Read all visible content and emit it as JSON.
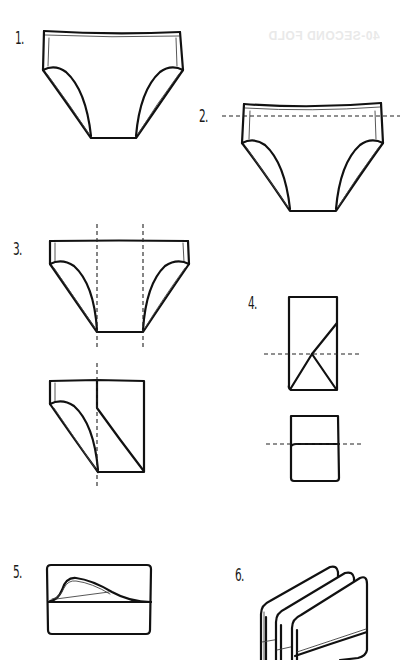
{
  "document": {
    "type": "folding-instructions",
    "subject": "briefs / underwear folding steps",
    "bleed_through_text": "40-SECOND FOLD"
  },
  "steps": [
    {
      "number": 1,
      "label": "1.",
      "description": "Lay briefs flat, front side up"
    },
    {
      "number": 2,
      "label": "2.",
      "description": "Fold waistband along horizontal dashed line"
    },
    {
      "number": 3,
      "label": "3.",
      "description": "Fold sides in along two vertical dashed lines"
    },
    {
      "number": 4,
      "label": "4.",
      "description": "Fold in half along horizontal dashed line"
    },
    {
      "number": 5,
      "label": "5.",
      "description": "Tuck into waistband pocket"
    },
    {
      "number": 6,
      "label": "6.",
      "description": "Store upright, stacked side by side"
    }
  ],
  "colors": {
    "ink": "#111111",
    "background": "#ffffff",
    "dash": "#222222"
  }
}
